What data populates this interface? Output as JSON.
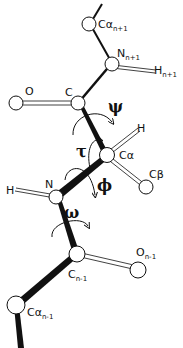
{
  "diagram": {
    "type": "peptide backbone ball-and-stick",
    "atoms": [
      {
        "id": "ca_np1",
        "label": "Cα",
        "sub": "n+1"
      },
      {
        "id": "n_np1",
        "label": "N",
        "sub": "n+1"
      },
      {
        "id": "h_np1",
        "label": "H",
        "sub": "n+1"
      },
      {
        "id": "o",
        "label": "O",
        "sub": ""
      },
      {
        "id": "c",
        "label": "C",
        "sub": ""
      },
      {
        "id": "h",
        "label": "H",
        "sub": ""
      },
      {
        "id": "ca",
        "label": "Cα",
        "sub": ""
      },
      {
        "id": "cb",
        "label": "Cβ",
        "sub": ""
      },
      {
        "id": "h_left",
        "label": "H",
        "sub": ""
      },
      {
        "id": "n",
        "label": "N",
        "sub": ""
      },
      {
        "id": "c_nm1",
        "label": "C",
        "sub": "n-1"
      },
      {
        "id": "o_nm1",
        "label": "O",
        "sub": "n-1"
      },
      {
        "id": "ca_nm1",
        "label": "Cα",
        "sub": "n-1"
      }
    ],
    "angles": {
      "psi": "ψ",
      "tau": "τ",
      "phi": "ϕ",
      "omega": "ω"
    }
  }
}
